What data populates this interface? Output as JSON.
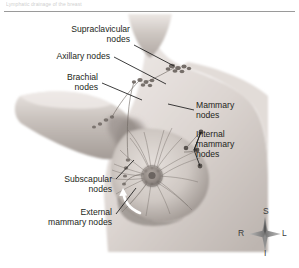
{
  "figure": {
    "title_fragment": "Lymphatic drainage of the breast",
    "type": "anatomical-illustration",
    "style": "grayscale pencil rendering",
    "divider_present": true
  },
  "labels": [
    {
      "id": "supraclavicular",
      "text": "Supraclavicular\nnodes",
      "side": "left"
    },
    {
      "id": "axillary",
      "text": "Axillary nodes",
      "side": "left"
    },
    {
      "id": "brachial",
      "text": "Brachial\nnodes",
      "side": "left"
    },
    {
      "id": "subscapular",
      "text": "Subscapular\nnodes",
      "side": "left"
    },
    {
      "id": "external_mammary",
      "text": "External\nmammary nodes",
      "side": "left"
    },
    {
      "id": "mammary",
      "text": "Mammary\nnodes",
      "side": "right"
    },
    {
      "id": "internal_mammary",
      "text": "Internal\nmammary\nnodes",
      "side": "right"
    }
  ],
  "compass": {
    "superior": "S",
    "right": "R",
    "left": "L",
    "inferior": "I"
  },
  "colors": {
    "background": "#ffffff",
    "text": "#231f20",
    "leader_line": "#1a1a1a",
    "rule": "#9a9a9a",
    "skin_light": "#f2efed",
    "skin_mid": "#c9c2bd",
    "skin_dark": "#8d8681",
    "node_dark": "#5e5955",
    "arrow_white": "#ffffff"
  }
}
